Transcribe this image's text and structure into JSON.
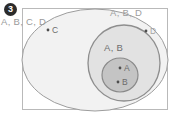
{
  "figure": {
    "marker": "3",
    "frame": {
      "border_color": "#b9b9b9",
      "background": "#ffffff"
    }
  },
  "labels": {
    "outside": "A, B, C, D",
    "outer_ellipse": "A, B, D",
    "middle_ellipse": "A, B"
  },
  "points": [
    {
      "id": "point-c",
      "label": "C",
      "x": 48,
      "y": 30,
      "dot_color": "#4d4d4d",
      "label_color": "#6b6b6b"
    },
    {
      "id": "point-d",
      "label": "D",
      "x": 146,
      "y": 31,
      "dot_color": "#4d4d4d",
      "label_color": "#a5a5a5"
    },
    {
      "id": "point-a",
      "label": "A",
      "x": 120,
      "y": 68,
      "dot_color": "#4d4d4d",
      "label_color": "#6b6b6b"
    },
    {
      "id": "point-b",
      "label": "B",
      "x": 118,
      "y": 82,
      "dot_color": "#4d4d4d",
      "label_color": "#6b6b6b"
    }
  ],
  "regions": [
    {
      "id": "outer-ellipse",
      "name": "A, B, D",
      "cx": 95,
      "cy": 60,
      "rx": 73,
      "ry": 51,
      "fill": "#f2f2f2",
      "stroke": "#9d9d9d"
    },
    {
      "id": "middle-ellipse",
      "name": "A, B",
      "cx": 124,
      "cy": 63,
      "rx": 36,
      "ry": 38,
      "fill": "#e2e2e2",
      "stroke": "#8e8e8e"
    },
    {
      "id": "inner-ellipse",
      "name": "A and B points",
      "cx": 120,
      "cy": 75,
      "rx": 18,
      "ry": 17,
      "fill": "#c4c4c4",
      "stroke": "#8a8a8a"
    }
  ],
  "chart_data": {
    "type": "diagram",
    "title": "",
    "diagram_kind": "euler-nested-sets",
    "marker": "3",
    "sets": [
      {
        "name": "universe",
        "label": "A, B, C, D",
        "members": [
          "A",
          "B",
          "C",
          "D"
        ],
        "level": 0
      },
      {
        "name": "outer",
        "label": "A, B, D",
        "members": [
          "A",
          "B",
          "D"
        ],
        "level": 1
      },
      {
        "name": "middle",
        "label": "A, B",
        "members": [
          "A",
          "B"
        ],
        "level": 2
      },
      {
        "name": "inner",
        "label": "",
        "members": [
          "A",
          "B"
        ],
        "level": 3
      }
    ],
    "elements": [
      {
        "name": "C",
        "innermost_set": "universe"
      },
      {
        "name": "D",
        "innermost_set": "outer"
      },
      {
        "name": "A",
        "innermost_set": "inner"
      },
      {
        "name": "B",
        "innermost_set": "inner"
      }
    ]
  }
}
